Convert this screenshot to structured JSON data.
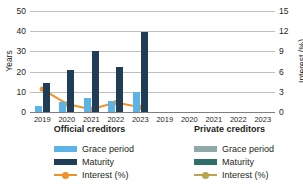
{
  "chart_data": {
    "type": "bar",
    "title": "",
    "xlabel": "",
    "ylabel": "Years",
    "y2label": "Interest (%)",
    "categories": [
      "2019",
      "2020",
      "2021",
      "2022",
      "2023"
    ],
    "ylim": [
      0,
      50
    ],
    "yticks": [
      0,
      10,
      20,
      30,
      40,
      50
    ],
    "y2lim": [
      0,
      15
    ],
    "y2ticks": [
      0,
      3,
      6,
      9,
      12,
      15
    ],
    "grid": true,
    "legend_position": "bottom",
    "panels": [
      {
        "name": "Official creditors",
        "series": [
          {
            "name": "Grace period",
            "type": "bar",
            "axis": "left",
            "color": "#5BB4E5",
            "values": [
              3,
              5,
              7,
              5.5,
              10
            ]
          },
          {
            "name": "Maturity",
            "type": "bar",
            "axis": "left",
            "color": "#1F3D56",
            "values": [
              14.3,
              21,
              30,
              22.3,
              39.5
            ]
          },
          {
            "name": "Interest (%)",
            "type": "line",
            "axis": "right",
            "color": "#F0922B",
            "values": [
              3.4,
              1.2,
              0.4,
              1.4,
              0.7
            ]
          }
        ]
      },
      {
        "name": "Private creditors",
        "series": [
          {
            "name": "Grace period",
            "type": "bar",
            "axis": "left",
            "color": "#8FA9A8",
            "values": [
              null,
              null,
              null,
              null,
              null
            ]
          },
          {
            "name": "Maturity",
            "type": "bar",
            "axis": "left",
            "color": "#2E6F6A",
            "values": [
              null,
              null,
              null,
              null,
              null
            ]
          },
          {
            "name": "Interest (%)",
            "type": "line",
            "axis": "right",
            "color": "#B9A44F",
            "values": [
              null,
              null,
              null,
              null,
              null
            ]
          }
        ]
      }
    ]
  },
  "axes": {
    "left_title": "Years",
    "right_title": "Interest (%)",
    "left_ticks": [
      "50",
      "40",
      "30",
      "20",
      "10",
      "0"
    ],
    "right_ticks": [
      "15",
      "12",
      "9",
      "6",
      "3",
      "0"
    ]
  },
  "xaxis": {
    "official": [
      "2019",
      "2020",
      "2021",
      "2022",
      "2023"
    ],
    "private": [
      "2019",
      "2020",
      "2021",
      "2022",
      "2023"
    ]
  },
  "panels": {
    "official": {
      "title": "Official creditors"
    },
    "private": {
      "title": "Private creditors"
    }
  },
  "legend": {
    "official": [
      {
        "label": "Grace period",
        "color": "#5BB4E5",
        "marker": "swatch"
      },
      {
        "label": "Maturity",
        "color": "#1F3D56",
        "marker": "swatch"
      },
      {
        "label": "Interest (%)",
        "color": "#F0922B",
        "marker": "line"
      }
    ],
    "private": [
      {
        "label": "Grace period",
        "color": "#8FA9A8",
        "marker": "swatch"
      },
      {
        "label": "Maturity",
        "color": "#2E6F6A",
        "marker": "swatch"
      },
      {
        "label": "Interest (%)",
        "color": "#B9A44F",
        "marker": "line"
      }
    ]
  },
  "colors": {
    "grace_official": "#5BB4E5",
    "maturity_official": "#1F3D56",
    "interest_official": "#F0922B",
    "grace_private": "#8FA9A8",
    "maturity_private": "#2E6F6A",
    "interest_private": "#B9A44F",
    "gridline": "#BFBFBF",
    "text": "#231F20"
  }
}
